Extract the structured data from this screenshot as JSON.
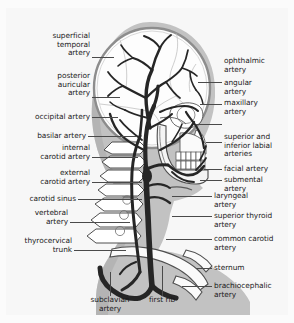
{
  "figure": {
    "background_color": "#f7f7f7",
    "artery_color": "#2b2b2b",
    "bone_color": "#ffffff",
    "soft_tissue_color": "#b9b9b9",
    "leader_color": "#4a4a4a",
    "text_color": "#1b1b1b"
  },
  "labels_left": [
    {
      "id": "superficial-temporal-artery",
      "text": "superficial\ntemporal\nartery"
    },
    {
      "id": "posterior-auricular-artery",
      "text": "posterior\nauricular\nartery"
    },
    {
      "id": "occipital-artery",
      "text": "occipital artery"
    },
    {
      "id": "basilar-artery",
      "text": "basilar artery"
    },
    {
      "id": "internal-carotid-artery",
      "text": "internal\ncarotid artery"
    },
    {
      "id": "external-carotid-artery",
      "text": "external\ncarotid artery"
    },
    {
      "id": "carotid-sinus",
      "text": "carotid sinus"
    },
    {
      "id": "vertebral-artery",
      "text": "vertebral\nartery"
    },
    {
      "id": "thyrocervical-trunk",
      "text": "thyrocervical\ntrunk"
    }
  ],
  "labels_right": [
    {
      "id": "ophthalmic-artery",
      "text": "ophthalmic\nartery"
    },
    {
      "id": "angular-artery",
      "text": "angular\nartery"
    },
    {
      "id": "maxillary-artery",
      "text": "maxillary\nartery"
    },
    {
      "id": "superior-and-inferior-labial-arteries",
      "text": "superior and\ninferior labial\narteries"
    },
    {
      "id": "facial-artery",
      "text": "facial artery"
    },
    {
      "id": "submental-artery",
      "text": "submental\nartery"
    },
    {
      "id": "laryngeal-artery",
      "text": "laryngeal\nartery"
    },
    {
      "id": "superior-thyroid-artery",
      "text": "superior thyroid\nartery"
    },
    {
      "id": "common-carotid-artery",
      "text": "common carotid\nartery"
    },
    {
      "id": "sternum",
      "text": "sternum"
    },
    {
      "id": "brachiocephalic-artery",
      "text": "brachiocephalic\nartery"
    }
  ],
  "labels_bottom": [
    {
      "id": "subclavian-artery",
      "text": "subclavian\nartery"
    },
    {
      "id": "first-rib",
      "text": "first rib"
    }
  ]
}
